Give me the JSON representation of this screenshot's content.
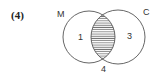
{
  "problem_number": "(4)",
  "venn": {
    "sets": [
      {
        "name": "M",
        "cx": 89,
        "cy": 37,
        "r": 26
      },
      {
        "name": "C",
        "cx": 118,
        "cy": 37,
        "r": 27
      }
    ],
    "regions": {
      "M_only": "1",
      "C_only": "3",
      "outside": "4"
    },
    "shaded_region": "M∩C",
    "shading": "horizontal-hatch",
    "stroke_color": "#555555"
  }
}
